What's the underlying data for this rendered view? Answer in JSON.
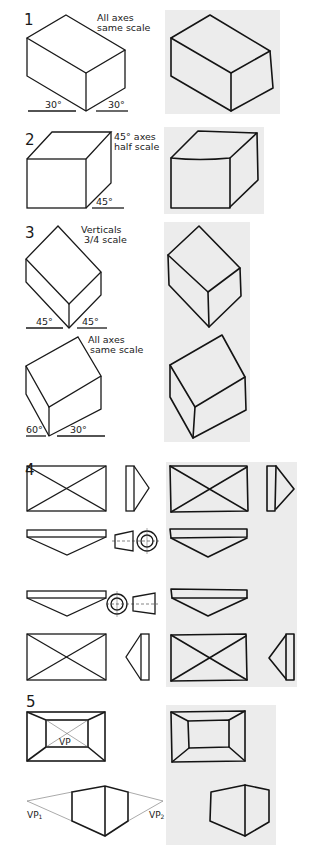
{
  "figure": {
    "colors": {
      "ink": "#1a1a1a",
      "sketch_panel": "#ececec",
      "background": "#ffffff"
    },
    "sections": [
      {
        "number": "1",
        "projection": "isometric box",
        "note_line1": "All axes",
        "note_line2": "same scale",
        "angle_left": "30°",
        "angle_right": "30°"
      },
      {
        "number": "2",
        "projection": "oblique box",
        "note_line1": "45° axes",
        "note_line2": "half scale",
        "angle_right": "45°"
      },
      {
        "number": "3",
        "projection": "dimetric / planometric boxes",
        "note_line1": "Verticals",
        "note_line2": "3/4 scale",
        "angle_left": "45°",
        "angle_right": "45°",
        "second_note_line1": "All axes",
        "second_note_line2": "same scale",
        "second_angle_left": "60°",
        "second_angle_right": "30°"
      },
      {
        "number": "4",
        "projection": "orthographic views"
      },
      {
        "number": "5",
        "projection": "perspective",
        "vp_label": "VP",
        "vp1_label": "VP1",
        "vp1_main": "VP",
        "vp1_sub": "1",
        "vp2_main": "VP",
        "vp2_sub": "2"
      }
    ]
  }
}
